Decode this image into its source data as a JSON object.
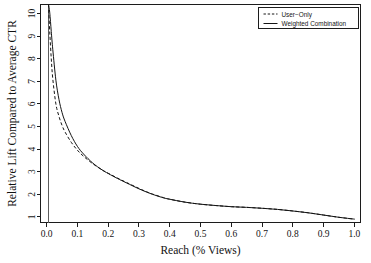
{
  "chart_data": {
    "type": "line",
    "title": "",
    "xlabel": "Reach (% Views)",
    "ylabel": "Relative Lift Compared to Average CTR",
    "xlim": [
      -0.02,
      1.02
    ],
    "ylim": [
      0.75,
      10.4
    ],
    "xticks": [
      "0.0",
      "0.1",
      "0.2",
      "0.3",
      "0.4",
      "0.5",
      "0.6",
      "0.7",
      "0.8",
      "0.9",
      "1.0"
    ],
    "xtick_values": [
      0.0,
      0.1,
      0.2,
      0.3,
      0.4,
      0.5,
      0.6,
      0.7,
      0.8,
      0.9,
      1.0
    ],
    "yticks": [
      "1",
      "2",
      "3",
      "4",
      "5",
      "6",
      "7",
      "8",
      "9",
      "10"
    ],
    "ytick_values": [
      1,
      2,
      3,
      4,
      5,
      6,
      7,
      8,
      9,
      10
    ],
    "grid": false,
    "legend_position": "top-right",
    "legend": [
      "User−Only",
      "Weighted Combination"
    ],
    "annotations": [
      {
        "type": "vertical-line",
        "x": 0.006,
        "label": ""
      }
    ],
    "series": [
      {
        "name": "User−Only",
        "style": "dashed",
        "color": "#141414",
        "x": [
          0.006,
          0.01,
          0.015,
          0.02,
          0.03,
          0.04,
          0.05,
          0.06,
          0.08,
          0.1,
          0.12,
          0.15,
          0.18,
          0.2,
          0.23,
          0.26,
          0.3,
          0.33,
          0.35,
          0.38,
          0.4,
          0.45,
          0.5,
          0.55,
          0.6,
          0.65,
          0.7,
          0.75,
          0.8,
          0.85,
          0.9,
          0.95,
          1.0
        ],
        "y": [
          10.4,
          9.2,
          8.0,
          7.1,
          6.0,
          5.45,
          5.05,
          4.75,
          4.3,
          3.95,
          3.68,
          3.35,
          3.08,
          2.93,
          2.72,
          2.52,
          2.26,
          2.08,
          1.98,
          1.85,
          1.78,
          1.65,
          1.56,
          1.5,
          1.45,
          1.42,
          1.38,
          1.33,
          1.26,
          1.18,
          1.08,
          0.98,
          0.9
        ]
      },
      {
        "name": "Weighted Combination",
        "style": "solid",
        "color": "#141414",
        "x": [
          0.006,
          0.01,
          0.015,
          0.02,
          0.03,
          0.04,
          0.05,
          0.06,
          0.08,
          0.1,
          0.12,
          0.15,
          0.18,
          0.2,
          0.23,
          0.26,
          0.3,
          0.33,
          0.35,
          0.38,
          0.4,
          0.45,
          0.5,
          0.55,
          0.6,
          0.65,
          0.7,
          0.75,
          0.8,
          0.85,
          0.9,
          0.95,
          1.0
        ],
        "y": [
          10.4,
          10.05,
          9.2,
          8.4,
          7.05,
          6.2,
          5.62,
          5.22,
          4.6,
          4.12,
          3.78,
          3.38,
          3.08,
          2.92,
          2.7,
          2.5,
          2.24,
          2.07,
          1.97,
          1.84,
          1.78,
          1.65,
          1.56,
          1.5,
          1.45,
          1.42,
          1.38,
          1.33,
          1.26,
          1.18,
          1.08,
          0.98,
          0.9
        ]
      }
    ]
  }
}
